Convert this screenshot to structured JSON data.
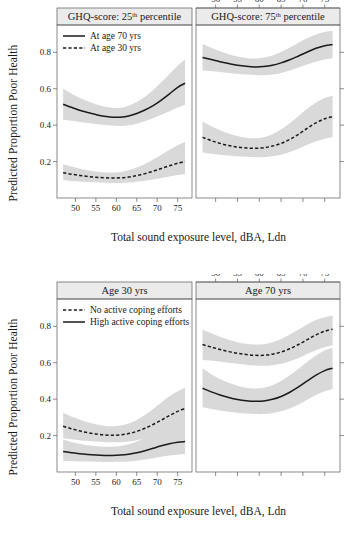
{
  "figure": {
    "axis_labels": {
      "x": "Total sound exposure level, dBA, Ldn",
      "y": "Predicted Proportion Poor Health"
    },
    "colors": {
      "line": "#1a1a1a",
      "band": "#d9d9d9",
      "strip_fill": "#ebebeb",
      "frame": "#5a5a5a",
      "background": "#ffffff"
    }
  },
  "chart_data": [
    {
      "type": "line",
      "id": "top-left",
      "title": "GHQ-score: 25",
      "title_sup": "th",
      "title_tail": " percentile",
      "xlabel": "Total sound exposure level, dBA, Ldn",
      "ylabel": "Predicted Proportion Poor Health",
      "xlim": [
        45.5,
        78.5
      ],
      "ylim": [
        0.0,
        0.95
      ],
      "xticks": [
        50,
        55,
        60,
        65,
        70,
        75
      ],
      "yticks": [
        0.2,
        0.4,
        0.6,
        0.8
      ],
      "grid": false,
      "axis_position": {
        "x": "bottom",
        "y": "left"
      },
      "legend": {
        "position": "top-left",
        "entries": [
          {
            "label": "At age 70 yrs",
            "style": "solid"
          },
          {
            "label": "At age 30 yrs",
            "style": "dashed"
          }
        ]
      },
      "series": [
        {
          "name": "At age 70 yrs",
          "style": "solid",
          "x": [
            47.0,
            49.0,
            51.0,
            53.0,
            55.0,
            57.0,
            59.0,
            61.0,
            63.0,
            65.0,
            67.0,
            69.0,
            71.0,
            73.0,
            75.0,
            76.8
          ],
          "values": [
            0.515,
            0.498,
            0.482,
            0.469,
            0.458,
            0.449,
            0.444,
            0.444,
            0.45,
            0.464,
            0.483,
            0.507,
            0.538,
            0.572,
            0.608,
            0.63
          ],
          "ci_lower": [
            0.43,
            0.424,
            0.418,
            0.412,
            0.407,
            0.402,
            0.398,
            0.396,
            0.399,
            0.408,
            0.422,
            0.438,
            0.457,
            0.477,
            0.497,
            0.512
          ],
          "ci_upper": [
            0.6,
            0.574,
            0.55,
            0.531,
            0.515,
            0.503,
            0.495,
            0.495,
            0.506,
            0.527,
            0.556,
            0.593,
            0.635,
            0.681,
            0.726,
            0.76
          ]
        },
        {
          "name": "At age 30 yrs",
          "style": "dashed",
          "x": [
            47.0,
            49.0,
            51.0,
            53.0,
            55.0,
            57.0,
            59.0,
            61.0,
            63.0,
            65.0,
            67.0,
            69.0,
            71.0,
            73.0,
            75.0,
            76.8
          ],
          "values": [
            0.139,
            0.131,
            0.124,
            0.118,
            0.114,
            0.111,
            0.11,
            0.111,
            0.115,
            0.123,
            0.134,
            0.147,
            0.162,
            0.177,
            0.191,
            0.201
          ],
          "ci_lower": [
            0.098,
            0.094,
            0.091,
            0.088,
            0.086,
            0.084,
            0.083,
            0.083,
            0.085,
            0.089,
            0.095,
            0.102,
            0.11,
            0.118,
            0.126,
            0.132
          ],
          "ci_upper": [
            0.186,
            0.173,
            0.162,
            0.152,
            0.145,
            0.141,
            0.14,
            0.143,
            0.152,
            0.167,
            0.187,
            0.211,
            0.238,
            0.265,
            0.29,
            0.307
          ]
        }
      ]
    },
    {
      "type": "line",
      "id": "top-right",
      "title": "GHQ-score: 75",
      "title_sup": "th",
      "title_tail": " percentile",
      "xlim": [
        45.5,
        78.5
      ],
      "ylim": [
        0.0,
        0.95
      ],
      "xticks": [
        50,
        55,
        60,
        65,
        70,
        75
      ],
      "yticks": [
        0.2,
        0.4,
        0.6,
        0.8
      ],
      "grid": false,
      "axis_position": {
        "x": "top",
        "y": "right"
      },
      "legend": {
        "position": "none",
        "entries": []
      },
      "series": [
        {
          "name": "At age 70 yrs",
          "style": "solid",
          "x": [
            47.0,
            49.0,
            51.0,
            53.0,
            55.0,
            57.0,
            59.0,
            61.0,
            63.0,
            65.0,
            67.0,
            69.0,
            71.0,
            73.0,
            75.0,
            76.8
          ],
          "values": [
            0.772,
            0.76,
            0.748,
            0.738,
            0.729,
            0.723,
            0.72,
            0.722,
            0.729,
            0.742,
            0.759,
            0.78,
            0.802,
            0.822,
            0.836,
            0.843
          ],
          "ci_lower": [
            0.7,
            0.696,
            0.692,
            0.687,
            0.682,
            0.678,
            0.675,
            0.674,
            0.678,
            0.687,
            0.7,
            0.716,
            0.733,
            0.748,
            0.76,
            0.767
          ],
          "ci_upper": [
            0.845,
            0.825,
            0.806,
            0.79,
            0.777,
            0.769,
            0.766,
            0.771,
            0.783,
            0.802,
            0.826,
            0.853,
            0.878,
            0.898,
            0.911,
            0.918
          ]
        },
        {
          "name": "At age 30 yrs",
          "style": "dashed",
          "x": [
            47.0,
            49.0,
            51.0,
            53.0,
            55.0,
            57.0,
            59.0,
            61.0,
            63.0,
            65.0,
            67.0,
            69.0,
            71.0,
            73.0,
            75.0,
            76.8
          ],
          "values": [
            0.333,
            0.315,
            0.3,
            0.288,
            0.28,
            0.275,
            0.273,
            0.276,
            0.285,
            0.3,
            0.322,
            0.35,
            0.383,
            0.413,
            0.435,
            0.446
          ],
          "ci_lower": [
            0.25,
            0.243,
            0.238,
            0.233,
            0.229,
            0.226,
            0.224,
            0.224,
            0.229,
            0.238,
            0.252,
            0.271,
            0.292,
            0.311,
            0.326,
            0.334
          ],
          "ci_upper": [
            0.42,
            0.394,
            0.372,
            0.354,
            0.34,
            0.331,
            0.328,
            0.334,
            0.35,
            0.376,
            0.41,
            0.45,
            0.49,
            0.524,
            0.549,
            0.562
          ]
        }
      ]
    },
    {
      "type": "line",
      "id": "bottom-left",
      "title": "Age 30 yrs",
      "title_sup": "",
      "title_tail": "",
      "xlabel": "Total sound exposure level, dBA, Ldn",
      "ylabel": "Predicted Proportion Poor Health",
      "xlim": [
        45.5,
        78.5
      ],
      "ylim": [
        0.0,
        0.95
      ],
      "xticks": [
        50,
        55,
        60,
        65,
        70,
        75
      ],
      "yticks": [
        0.2,
        0.4,
        0.6,
        0.8
      ],
      "grid": false,
      "axis_position": {
        "x": "bottom",
        "y": "left"
      },
      "legend": {
        "position": "top-left",
        "entries": [
          {
            "label": "No active coping efforts",
            "style": "dashed"
          },
          {
            "label": "High active coping efforts",
            "style": "solid"
          }
        ]
      },
      "series": [
        {
          "name": "No active coping efforts",
          "style": "dashed",
          "x": [
            47.0,
            49.0,
            51.0,
            53.0,
            55.0,
            57.0,
            59.0,
            61.0,
            63.0,
            65.0,
            67.0,
            69.0,
            71.0,
            73.0,
            75.0,
            76.8
          ],
          "values": [
            0.251,
            0.238,
            0.226,
            0.216,
            0.209,
            0.204,
            0.202,
            0.204,
            0.211,
            0.223,
            0.24,
            0.261,
            0.285,
            0.31,
            0.333,
            0.348
          ],
          "ci_lower": [
            0.186,
            0.18,
            0.175,
            0.171,
            0.167,
            0.165,
            0.163,
            0.164,
            0.168,
            0.175,
            0.186,
            0.2,
            0.216,
            0.232,
            0.247,
            0.257
          ],
          "ci_upper": [
            0.325,
            0.305,
            0.288,
            0.273,
            0.262,
            0.254,
            0.251,
            0.255,
            0.266,
            0.286,
            0.313,
            0.346,
            0.382,
            0.416,
            0.444,
            0.463
          ]
        },
        {
          "name": "High active coping efforts",
          "style": "solid",
          "x": [
            47.0,
            49.0,
            51.0,
            53.0,
            55.0,
            57.0,
            59.0,
            61.0,
            63.0,
            65.0,
            67.0,
            69.0,
            71.0,
            73.0,
            75.0,
            76.8
          ],
          "values": [
            0.113,
            0.106,
            0.1,
            0.096,
            0.093,
            0.091,
            0.091,
            0.093,
            0.098,
            0.106,
            0.117,
            0.13,
            0.144,
            0.155,
            0.163,
            0.167
          ],
          "ci_lower": [
            0.062,
            0.06,
            0.058,
            0.057,
            0.056,
            0.055,
            0.055,
            0.056,
            0.058,
            0.062,
            0.068,
            0.076,
            0.084,
            0.091,
            0.096,
            0.099
          ],
          "ci_upper": [
            0.178,
            0.165,
            0.155,
            0.147,
            0.142,
            0.139,
            0.139,
            0.143,
            0.152,
            0.167,
            0.188,
            0.214,
            0.241,
            0.263,
            0.277,
            0.284
          ]
        }
      ]
    },
    {
      "type": "line",
      "id": "bottom-right",
      "title": "Age 70 yrs",
      "title_sup": "",
      "title_tail": "",
      "xlim": [
        45.5,
        78.5
      ],
      "ylim": [
        0.0,
        0.95
      ],
      "xticks": [
        50,
        55,
        60,
        65,
        70,
        75
      ],
      "yticks": [
        0.2,
        0.4,
        0.6,
        0.8
      ],
      "grid": false,
      "axis_position": {
        "x": "top",
        "y": "right"
      },
      "legend": {
        "position": "none",
        "entries": []
      },
      "series": [
        {
          "name": "No active coping efforts",
          "style": "dashed",
          "x": [
            47.0,
            49.0,
            51.0,
            53.0,
            55.0,
            57.0,
            59.0,
            61.0,
            63.0,
            65.0,
            67.0,
            69.0,
            71.0,
            73.0,
            75.0,
            76.8
          ],
          "values": [
            0.7,
            0.686,
            0.673,
            0.661,
            0.652,
            0.645,
            0.641,
            0.641,
            0.647,
            0.659,
            0.677,
            0.7,
            0.727,
            0.753,
            0.773,
            0.784
          ],
          "ci_lower": [
            0.617,
            0.612,
            0.606,
            0.6,
            0.594,
            0.589,
            0.585,
            0.583,
            0.586,
            0.594,
            0.608,
            0.626,
            0.648,
            0.669,
            0.685,
            0.694
          ],
          "ci_upper": [
            0.783,
            0.762,
            0.743,
            0.726,
            0.713,
            0.704,
            0.7,
            0.702,
            0.713,
            0.731,
            0.755,
            0.783,
            0.81,
            0.834,
            0.85,
            0.858
          ]
        },
        {
          "name": "High active coping efforts",
          "style": "solid",
          "x": [
            47.0,
            49.0,
            51.0,
            53.0,
            55.0,
            57.0,
            59.0,
            61.0,
            63.0,
            65.0,
            67.0,
            69.0,
            71.0,
            73.0,
            75.0,
            76.8
          ],
          "values": [
            0.46,
            0.44,
            0.423,
            0.409,
            0.398,
            0.391,
            0.388,
            0.39,
            0.399,
            0.415,
            0.438,
            0.467,
            0.5,
            0.532,
            0.557,
            0.57
          ],
          "ci_lower": [
            0.355,
            0.346,
            0.338,
            0.331,
            0.325,
            0.321,
            0.318,
            0.318,
            0.323,
            0.333,
            0.349,
            0.371,
            0.397,
            0.423,
            0.444,
            0.455
          ],
          "ci_upper": [
            0.568,
            0.537,
            0.511,
            0.49,
            0.474,
            0.463,
            0.459,
            0.463,
            0.477,
            0.5,
            0.531,
            0.567,
            0.605,
            0.64,
            0.667,
            0.682
          ]
        }
      ]
    }
  ]
}
